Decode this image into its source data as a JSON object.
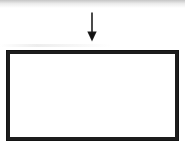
{
  "figure": {
    "kind": "line-diagram",
    "title": "",
    "caption": "Figure 1",
    "colors": {
      "ink": "#1d1d1d",
      "paper": "#ffffff",
      "faded_ink": "#8d8d8d",
      "scan_artifact": "#a0a0a0"
    },
    "elements": {
      "arrow": {
        "label": "down-arrow",
        "direction": "down",
        "shaft_length_px": 20,
        "head_width_px": 9,
        "head_height_px": 9,
        "stroke_width_px": 1.6,
        "x_px": 92,
        "y_top_px": 12,
        "y_tip_px": 41
      },
      "rectangle": {
        "label": "empty-rectangle",
        "x_px": 6,
        "y_px": 50,
        "width_px": 173,
        "height_px": 91,
        "border_width_px": 4,
        "fill": "#ffffff",
        "contents": ""
      }
    },
    "annotations": {
      "top_scan_band": "faint grey horizontal band from scanning",
      "caption_state": "clipped at page bottom edge"
    }
  }
}
